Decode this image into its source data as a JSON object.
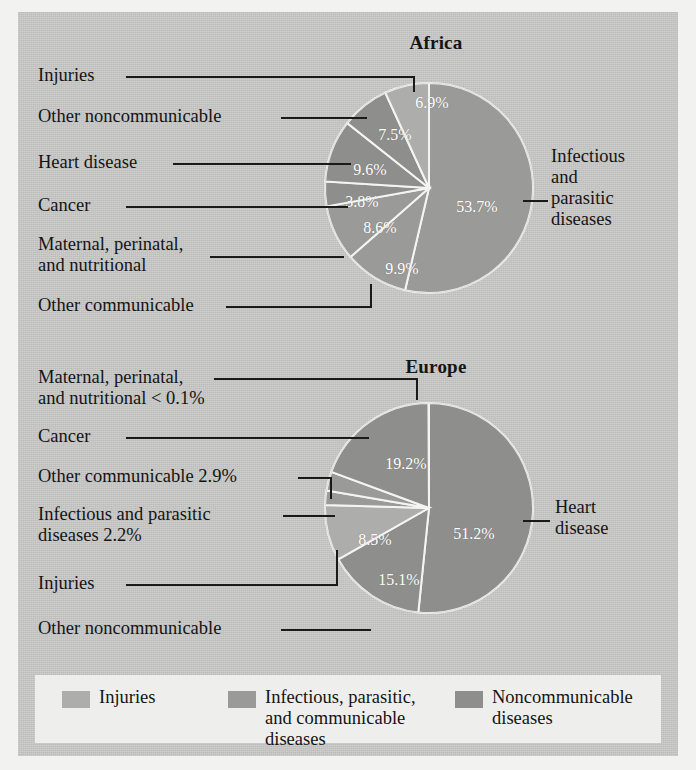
{
  "figure": {
    "background_color": "#c9c9c7",
    "outer_color": "#f2f2f0",
    "legend_background": "#eeeeec"
  },
  "chart_data": [
    {
      "type": "pie",
      "title": "Africa",
      "categories": [
        "Infectious and parasitic diseases",
        "Other communicable",
        "Maternal, perinatal, and nutritional",
        "Cancer",
        "Heart disease",
        "Other noncommunicable",
        "Injuries"
      ],
      "values": [
        53.7,
        9.9,
        8.6,
        3.8,
        9.6,
        7.5,
        6.9
      ],
      "value_labels": [
        "53.7%",
        "9.9%",
        "8.6%",
        "3.8%",
        "9.6%",
        "7.5%",
        "6.9%"
      ],
      "groups": [
        "Infectious, parasitic, and communicable diseases",
        "Infectious, parasitic, and communicable diseases",
        "Infectious, parasitic, and communicable diseases",
        "Noncommunicable diseases",
        "Noncommunicable diseases",
        "Noncommunicable diseases",
        "Injuries"
      ],
      "slice_colors": [
        "#9a9a98",
        "#9a9a98",
        "#9a9a98",
        "#8e8e8c",
        "#8e8e8c",
        "#8e8e8c",
        "#adadab"
      ],
      "start_angle_deg": 0,
      "direction": "clockwise",
      "xlabel": "",
      "ylabel": "",
      "legend_position": "bottom"
    },
    {
      "type": "pie",
      "title": "Europe",
      "categories": [
        "Heart disease",
        "Other noncommunicable",
        "Injuries",
        "Infectious and parasitic diseases",
        "Other communicable",
        "Cancer",
        "Maternal, perinatal, and nutritional"
      ],
      "values": [
        51.2,
        15.1,
        8.5,
        2.2,
        2.9,
        19.2,
        0.05
      ],
      "value_labels": [
        "51.2%",
        "15.1%",
        "8.5%",
        "2.2%",
        "2.9%",
        "19.2%",
        "< 0.1%"
      ],
      "groups": [
        "Noncommunicable diseases",
        "Noncommunicable diseases",
        "Injuries",
        "Infectious, parasitic, and communicable diseases",
        "Infectious, parasitic, and communicable diseases",
        "Noncommunicable diseases",
        "Infectious, parasitic, and communicable diseases"
      ],
      "slice_colors": [
        "#8e8e8c",
        "#8e8e8c",
        "#adadab",
        "#9a9a98",
        "#9a9a98",
        "#8e8e8c",
        "#9a9a98"
      ],
      "start_angle_deg": 0,
      "direction": "clockwise",
      "xlabel": "",
      "ylabel": "",
      "legend_position": "bottom"
    }
  ],
  "africa": {
    "title": "Africa",
    "slice_labels": {
      "infectious": "53.7%",
      "other_communicable": "9.9%",
      "maternal": "8.6%",
      "cancer": "3.8%",
      "heart": "9.6%",
      "other_noncommunicable": "7.5%",
      "injuries": "6.9%"
    },
    "callouts": {
      "injuries": "Injuries",
      "other_noncommunicable": "Other noncommunicable",
      "heart_disease": "Heart disease",
      "cancer": "Cancer",
      "maternal": "Maternal, perinatal,\nand nutritional",
      "other_communicable": "Other communicable",
      "infectious": "Infectious\nand\nparasitic\ndiseases"
    }
  },
  "europe": {
    "title": "Europe",
    "slice_labels": {
      "heart": "51.2%",
      "other_noncommunicable": "15.1%",
      "injuries": "8.5%",
      "cancer": "19.2%"
    },
    "callouts": {
      "maternal": "Maternal, perinatal,\nand nutritional < 0.1%",
      "cancer": "Cancer",
      "other_communicable": "Other communicable 2.9%",
      "infectious": "Infectious and parasitic\ndiseases 2.2%",
      "injuries": "Injuries",
      "other_noncommunicable": "Other noncommunicable",
      "heart_disease": "Heart\ndisease"
    }
  },
  "legend": {
    "items": [
      {
        "label": "Injuries",
        "color": "#adadab"
      },
      {
        "label": "Infectious, parasitic,\nand communicable\ndiseases",
        "color": "#9a9a98"
      },
      {
        "label": "Noncommunicable\ndiseases",
        "color": "#8e8e8c"
      }
    ]
  }
}
